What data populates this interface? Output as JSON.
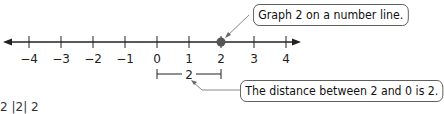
{
  "number_line": {
    "ticks": [
      "−4",
      "−3",
      "−2",
      "−1",
      "0",
      "1",
      "2",
      "3",
      "4"
    ],
    "plotted_point": "2",
    "point_color": "#555555",
    "line_color": "#222222"
  },
  "distance_bracket": {
    "from": "0",
    "to": "2",
    "label": "2"
  },
  "callouts": {
    "graph": "Graph 2 on a number line.",
    "distance": "The distance between 2 and 0 is 2."
  },
  "partial_text": "2  |2|  2"
}
